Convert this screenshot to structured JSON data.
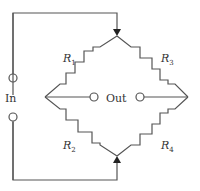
{
  "diagram": {
    "type": "wheatstone-bridge",
    "labels": {
      "input": "In",
      "output": "Out"
    },
    "resistors": [
      {
        "id": "R1",
        "letter": "R",
        "sub": "1",
        "position": "upper-left"
      },
      {
        "id": "R2",
        "letter": "R",
        "sub": "2",
        "position": "lower-left"
      },
      {
        "id": "R3",
        "letter": "R",
        "sub": "3",
        "position": "upper-right"
      },
      {
        "id": "R4",
        "letter": "R",
        "sub": "4",
        "position": "lower-right"
      }
    ],
    "colors": {
      "line": "#555555",
      "text": "#333333",
      "background": "#ffffff"
    }
  }
}
